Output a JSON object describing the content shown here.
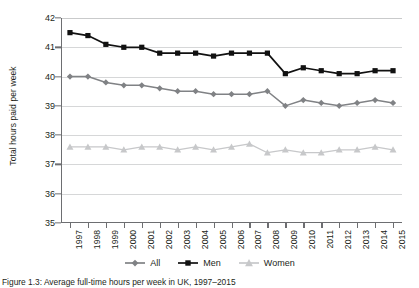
{
  "figure": {
    "caption": "Figure 1.3: Average full-time hours per week in UK, 1997–2015"
  },
  "legend": {
    "position": "bottom-center",
    "items": [
      {
        "label": "All",
        "marker": "diamond-marker-icon",
        "color": "#808285"
      },
      {
        "label": "Men",
        "marker": "square-marker-icon",
        "color": "#111111"
      },
      {
        "label": "Women",
        "marker": "triangle-marker-icon",
        "color": "#c7c8ca"
      }
    ]
  },
  "chart_data": {
    "type": "line",
    "title": "",
    "xlabel": "",
    "ylabel": "Total hours paid per week",
    "ylim": [
      35,
      42
    ],
    "yticks": [
      35,
      36,
      37,
      38,
      39,
      40,
      41,
      42
    ],
    "grid": true,
    "categories": [
      "1997",
      "1998",
      "1999",
      "2000",
      "2001",
      "2002",
      "2003",
      "2004",
      "2005",
      "2006",
      "2007",
      "2008",
      "2009",
      "2010",
      "2011",
      "2012",
      "2013",
      "2014",
      "2015"
    ],
    "series": [
      {
        "name": "All",
        "color": "#808285",
        "marker": "diamond",
        "values": [
          40.0,
          40.0,
          39.8,
          39.7,
          39.7,
          39.6,
          39.5,
          39.5,
          39.4,
          39.4,
          39.4,
          39.5,
          39.0,
          39.2,
          39.1,
          39.0,
          39.1,
          39.2,
          39.1
        ]
      },
      {
        "name": "Men",
        "color": "#111111",
        "marker": "square",
        "values": [
          41.5,
          41.4,
          41.1,
          41.0,
          41.0,
          40.8,
          40.8,
          40.8,
          40.7,
          40.8,
          40.8,
          40.8,
          40.1,
          40.3,
          40.2,
          40.1,
          40.1,
          40.2,
          40.2
        ]
      },
      {
        "name": "Women",
        "color": "#c7c8ca",
        "marker": "triangle",
        "values": [
          37.6,
          37.6,
          37.6,
          37.5,
          37.6,
          37.6,
          37.5,
          37.6,
          37.5,
          37.6,
          37.7,
          37.4,
          37.5,
          37.4,
          37.4,
          37.5,
          37.5,
          37.6,
          37.5
        ]
      }
    ]
  }
}
